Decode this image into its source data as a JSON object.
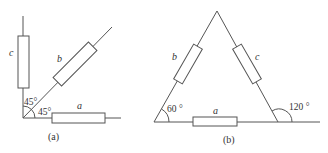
{
  "figure_a": {
    "caption": "(a)",
    "labels": {
      "a": "a",
      "b": "b",
      "c": "c"
    },
    "angles": {
      "upper": "45°",
      "lower": "45°"
    }
  },
  "figure_b": {
    "caption": "(b)",
    "labels": {
      "a": "a",
      "b": "b",
      "c": "c"
    },
    "angles": {
      "left": "60 °",
      "right": "120 °"
    }
  }
}
